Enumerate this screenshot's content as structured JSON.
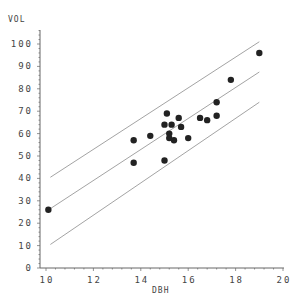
{
  "chart_data": {
    "type": "scatter",
    "title": "",
    "xlabel": "DBH",
    "ylabel": "VOL",
    "xlim": [
      10,
      20
    ],
    "ylim": [
      0,
      100
    ],
    "x_ticks": [
      "10",
      "12",
      "14",
      "16",
      "18",
      "20"
    ],
    "y_ticks": [
      "0",
      "10",
      "20",
      "30",
      "40",
      "50",
      "60",
      "70",
      "80",
      "90",
      "100"
    ],
    "grid": false,
    "legend": null,
    "points": [
      {
        "x": 10.1,
        "y": 26
      },
      {
        "x": 13.7,
        "y": 57
      },
      {
        "x": 13.7,
        "y": 47
      },
      {
        "x": 14.4,
        "y": 59
      },
      {
        "x": 15.0,
        "y": 64
      },
      {
        "x": 15.0,
        "y": 48
      },
      {
        "x": 15.1,
        "y": 69
      },
      {
        "x": 15.3,
        "y": 64
      },
      {
        "x": 15.2,
        "y": 60
      },
      {
        "x": 15.2,
        "y": 58
      },
      {
        "x": 15.4,
        "y": 57
      },
      {
        "x": 15.6,
        "y": 67
      },
      {
        "x": 15.7,
        "y": 63
      },
      {
        "x": 16.0,
        "y": 58
      },
      {
        "x": 16.5,
        "y": 67
      },
      {
        "x": 16.8,
        "y": 66
      },
      {
        "x": 17.2,
        "y": 68
      },
      {
        "x": 17.2,
        "y": 74
      },
      {
        "x": 17.8,
        "y": 84
      },
      {
        "x": 19.0,
        "y": 96
      }
    ],
    "lines": [
      {
        "name": "upper prediction bound",
        "x": [
          10.1,
          19.0
        ],
        "y": [
          40.5,
          101
        ]
      },
      {
        "name": "fitted regression",
        "x": [
          10.1,
          19.0
        ],
        "y": [
          26.5,
          87.5
        ]
      },
      {
        "name": "lower prediction bound",
        "x": [
          10.1,
          19.0
        ],
        "y": [
          10.5,
          74
        ]
      }
    ],
    "colors": {
      "points": "#222222",
      "lines": "#999999",
      "axis": "#666666",
      "text": "#444444"
    }
  }
}
